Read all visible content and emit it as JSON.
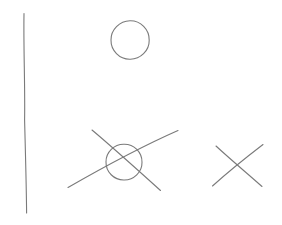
{
  "canvas": {
    "width": 282,
    "height": 225,
    "background_color": "#ffffff",
    "title": "Hand-drawn sketch: vertical line, circle, circled cross, cross"
  },
  "style": {
    "stroke_color": "#7a7a7a",
    "stroke_color_light": "#8d8d8d",
    "stroke_width": 1.1
  },
  "shapes": [
    {
      "id": "vertical-line",
      "name": "vertical-line",
      "kind": "line",
      "label": "Vertical stroke",
      "path": "M24.0,13.5 C23.4,48.0 25.2,86.0 24.6,120.0 C25.4,152.0 26.4,186.0 26.6,213.0",
      "x1": 24,
      "y1": 13,
      "x2": 27,
      "y2": 213
    },
    {
      "id": "top-circle",
      "name": "top-circle",
      "kind": "circle",
      "label": "Circle",
      "cx": 130,
      "cy": 40,
      "r": 19,
      "path": "M130.0,20.8 C140.6,20.6 149.4,29.6 149.2,40.2 C149.4,50.6 140.4,59.4 130.0,59.2 C119.4,59.4 110.8,50.4 111.0,40.0 C110.8,29.8 119.6,21.0 130.0,20.8 Z"
    },
    {
      "id": "circled-cross-circle",
      "name": "circled-cross-circle",
      "kind": "circle",
      "label": "Circle of circled cross",
      "cx": 124,
      "cy": 162,
      "r": 18,
      "path": "M124.0,144.2 C134.0,144.0 142.2,152.4 142.0,162.2 C142.2,172.0 133.8,180.2 124.0,180.0 C114.0,180.2 105.8,171.8 106.0,162.0 C105.8,152.2 114.2,144.0 124.0,144.2 Z"
    },
    {
      "id": "circled-cross-stroke-descending",
      "name": "circled-cross-descending-stroke",
      "kind": "line",
      "label": "Descending diagonal of circled cross",
      "path": "M92.0,130.0 C110.0,145.0 140.0,172.0 160.5,190.5",
      "x1": 92,
      "y1": 130,
      "x2": 160,
      "y2": 190
    },
    {
      "id": "circled-cross-stroke-ascending",
      "name": "circled-cross-ascending-stroke",
      "kind": "line",
      "label": "Ascending diagonal of circled cross",
      "path": "M68.0,187.5 C95.0,172.0 145.0,145.0 178.0,130.5",
      "x1": 68,
      "y1": 187,
      "x2": 178,
      "y2": 131
    },
    {
      "id": "right-cross-stroke-descending",
      "name": "right-cross-descending-stroke",
      "kind": "line",
      "label": "Descending diagonal of cross",
      "path": "M216.0,146.0 C230.0,159.0 248.0,174.0 262.0,186.5",
      "x1": 216,
      "y1": 146,
      "x2": 262,
      "y2": 186
    },
    {
      "id": "right-cross-stroke-ascending",
      "name": "right-cross-ascending-stroke",
      "kind": "line",
      "label": "Ascending diagonal of cross",
      "path": "M212.5,186.0 C228.0,172.0 248.0,156.0 263.0,144.5",
      "x1": 212,
      "y1": 186,
      "x2": 263,
      "y2": 144
    }
  ]
}
